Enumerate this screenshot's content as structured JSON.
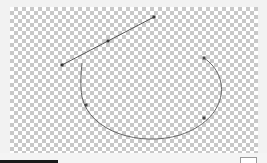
{
  "canvas": {
    "background": "transparency-checkerboard",
    "stroke_color": "#555555",
    "handle_color": "#333333",
    "line": {
      "x1": 52,
      "y1": 58,
      "x2": 144,
      "y2": 10,
      "mid_x": 98,
      "mid_y": 34
    },
    "arc": {
      "path": "M194 51 C 222 70, 218 112, 170 128 C 130 140, 80 125, 72 90 C 70 78, 71 66, 72 56",
      "handles": [
        {
          "x": 194,
          "y": 51
        },
        {
          "x": 194,
          "y": 111
        },
        {
          "x": 76,
          "y": 98
        }
      ]
    }
  },
  "statusbar": {
    "text": "",
    "box_label": ""
  }
}
